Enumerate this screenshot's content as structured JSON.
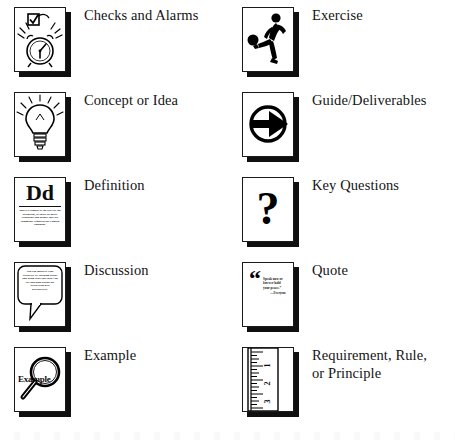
{
  "page": {
    "kind": "icon-legend-key",
    "background_color": "#ffffff",
    "text_color": "#141414",
    "columns": 2,
    "rows_per_column": 5
  },
  "legend": {
    "left_column": [
      {
        "icon": "checkmark-and-alarm-clock-icon",
        "label_line1": "Checks and Alarms",
        "label_line2": ""
      },
      {
        "icon": "lightbulb-icon",
        "label_line1": "Concept or Idea",
        "label_line2": ""
      },
      {
        "icon": "dictionary-entry-icon",
        "label_line1": "Definition",
        "label_line2": "",
        "icon_headword": "Dd",
        "icon_microtext": "This is a sample of the text for the definition, or those set more synonyms and usages that are commonly found in the English language."
      },
      {
        "icon": "speech-bubble-icon",
        "label_line1": "Discussion",
        "label_line2": "",
        "icon_microtext": "You can improve your creativity by learning about and using tools that help you see and understand the world from new perspectives."
      },
      {
        "icon": "magnifying-glass-icon",
        "label_line1": "Example",
        "label_line2": "",
        "icon_word": "Example"
      }
    ],
    "right_column": [
      {
        "icon": "person-kicking-ball-icon",
        "label_line1": "Exercise",
        "label_line2": ""
      },
      {
        "icon": "circled-right-arrow-icon",
        "label_line1": "Guide/Deliverables",
        "label_line2": ""
      },
      {
        "icon": "question-mark-icon",
        "label_line1": "Key Questions",
        "label_line2": "",
        "icon_glyph": "?"
      },
      {
        "icon": "quotation-mark-icon",
        "label_line1": "Quote",
        "label_line2": "",
        "icon_quote_mark": "“",
        "icon_quote_text": "Speak now or forever hold your peace.”",
        "icon_quote_attrib": "—Everyone"
      },
      {
        "icon": "ruler-icon",
        "label_line1": "Requirement, Rule,",
        "label_line2": "or Principle",
        "icon_tick_labels": [
          "1",
          "2",
          "3"
        ]
      }
    ]
  }
}
